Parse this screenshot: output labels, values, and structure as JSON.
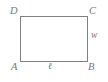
{
  "figure": {
    "kind": "rectangle-diagram",
    "background_color": "#ffffff",
    "stroke_color": "#808080",
    "label_color": "#777777",
    "fill_color": "#ffffff",
    "stroke_width": 1,
    "rectangle": {
      "left": 20,
      "top": 16,
      "right": 88,
      "bottom": 62,
      "width_px": 68,
      "height_px": 46
    },
    "vertices": [
      {
        "name": "top-left",
        "label": "D",
        "x": 20,
        "y": 16
      },
      {
        "name": "top-right",
        "label": "C",
        "x": 88,
        "y": 16
      },
      {
        "name": "bottom-left",
        "label": "A",
        "x": 20,
        "y": 62
      },
      {
        "name": "bottom-right",
        "label": "B",
        "x": 88,
        "y": 62
      }
    ],
    "side_labels": [
      {
        "name": "bottom-side-length",
        "label": "ℓ",
        "side": "AB",
        "position": "below-center"
      },
      {
        "name": "right-side-width",
        "label": "w",
        "side": "BC",
        "position": "right-middle"
      }
    ]
  }
}
